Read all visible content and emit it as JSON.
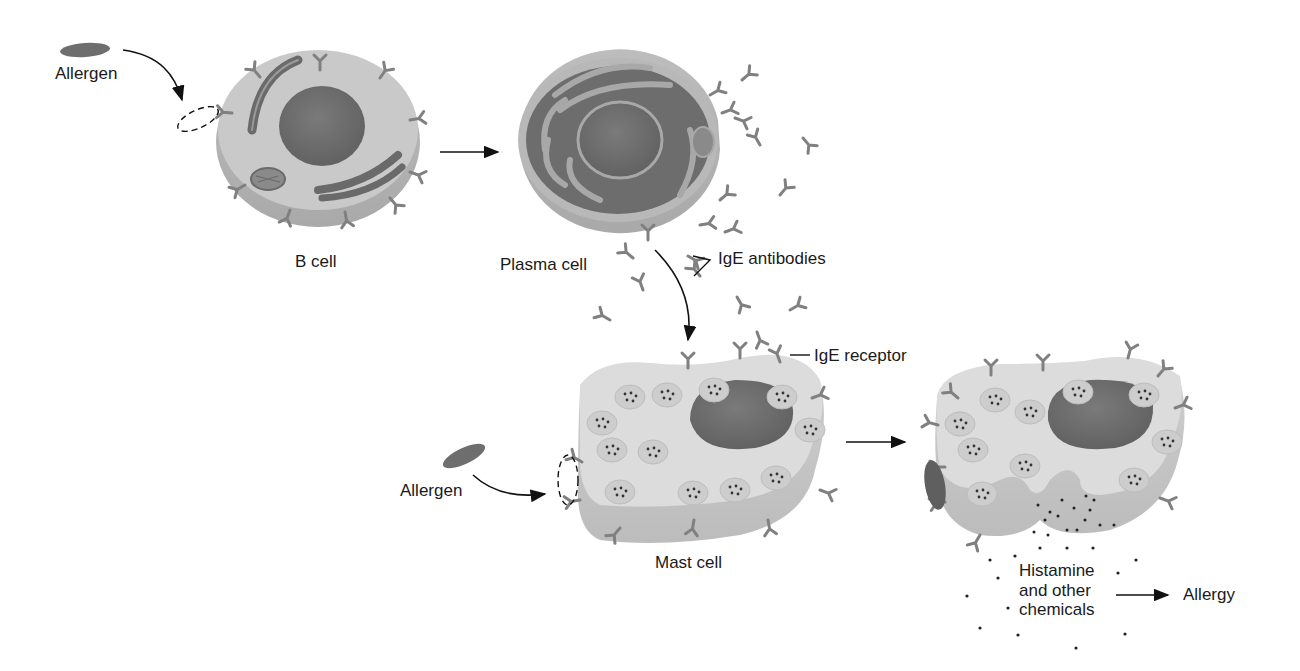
{
  "diagram": {
    "colors": {
      "cytoplasm": "#c9c9c9",
      "cytoplasm_side": "#b3b3b3",
      "mast_cytoplasm": "#dcdcdc",
      "mast_side": "#c4c4c4",
      "nucleus": "#707070",
      "organelle": "#6a6a6a",
      "antibody": "#808080",
      "allergen": "#6e6e6e",
      "line": "#111111",
      "text": "#1a1a1a"
    },
    "labels": {
      "allergen_1": "Allergen",
      "b_cell": "B cell",
      "plasma_cell": "Plasma cell",
      "ige_antibodies": "IgE antibodies",
      "ige_receptor": "IgE receptor",
      "allergen_2": "Allergen",
      "mast_cell": "Mast cell",
      "histamine_line1": "Histamine",
      "histamine_line2": "and other",
      "histamine_line3": "chemicals",
      "allergy": "Allergy"
    },
    "nodes": [
      {
        "id": "allergen_1",
        "label": "Allergen"
      },
      {
        "id": "b_cell",
        "label": "B cell"
      },
      {
        "id": "plasma_cell",
        "label": "Plasma cell"
      },
      {
        "id": "ige_antibodies",
        "label": "IgE antibodies"
      },
      {
        "id": "mast_cell",
        "label": "Mast cell"
      },
      {
        "id": "allergen_2",
        "label": "Allergen"
      },
      {
        "id": "activated_mast_cell",
        "label": ""
      },
      {
        "id": "histamine",
        "label": "Histamine and other chemicals"
      },
      {
        "id": "allergy",
        "label": "Allergy"
      }
    ],
    "edges": [
      {
        "from": "allergen_1",
        "to": "b_cell"
      },
      {
        "from": "b_cell",
        "to": "plasma_cell"
      },
      {
        "from": "plasma_cell",
        "to": "ige_antibodies"
      },
      {
        "from": "ige_antibodies",
        "to": "mast_cell"
      },
      {
        "from": "allergen_2",
        "to": "mast_cell"
      },
      {
        "from": "mast_cell",
        "to": "activated_mast_cell"
      },
      {
        "from": "histamine",
        "to": "allergy"
      }
    ]
  }
}
